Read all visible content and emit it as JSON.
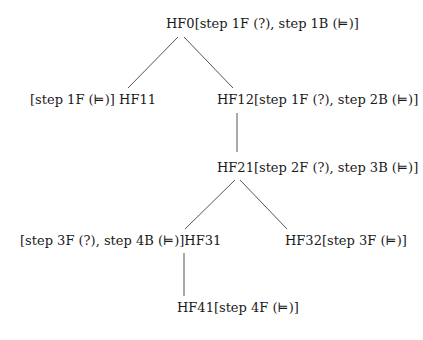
{
  "diagram": {
    "type": "tree",
    "nodes": [
      {
        "id": "HF0",
        "label": "HF0[step 1F (?), step 1B (⊨)]",
        "x": 166,
        "y": 16
      },
      {
        "id": "HF11",
        "label": "[step 1F (⊨)] HF11",
        "x": 30,
        "y": 92
      },
      {
        "id": "HF12",
        "label": "HF12[step 1F (?), step 2B (⊨)]",
        "x": 217,
        "y": 92
      },
      {
        "id": "HF21",
        "label": "HF21[step 2F (?), step 3B (⊨)]",
        "x": 217,
        "y": 160
      },
      {
        "id": "HF31",
        "label": "[step 3F (?), step 4B (⊨)]HF31",
        "x": 20,
        "y": 233
      },
      {
        "id": "HF32",
        "label": "HF32[step 3F (⊨)]",
        "x": 285,
        "y": 233
      },
      {
        "id": "HF41",
        "label": "HF41[step 4F (⊨)]",
        "x": 177,
        "y": 300
      }
    ],
    "edges": [
      {
        "from": "HF0",
        "to": "HF11",
        "x1": 178,
        "y1": 37,
        "x2": 128,
        "y2": 88
      },
      {
        "from": "HF0",
        "to": "HF12",
        "x1": 184,
        "y1": 37,
        "x2": 233,
        "y2": 88
      },
      {
        "from": "HF12",
        "to": "HF21",
        "x1": 237,
        "y1": 113,
        "x2": 237,
        "y2": 152
      },
      {
        "from": "HF21",
        "to": "HF31",
        "x1": 235,
        "y1": 180,
        "x2": 185,
        "y2": 229
      },
      {
        "from": "HF21",
        "to": "HF32",
        "x1": 240,
        "y1": 180,
        "x2": 287,
        "y2": 229
      },
      {
        "from": "HF31",
        "to": "HF41",
        "x1": 184,
        "y1": 253,
        "x2": 184,
        "y2": 296
      }
    ]
  }
}
